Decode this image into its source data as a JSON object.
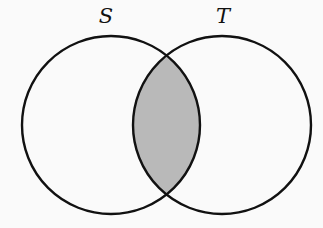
{
  "diagram": {
    "type": "venn",
    "sets": [
      {
        "label": "S",
        "cx": 111,
        "cy": 125,
        "r": 89,
        "label_x": 106,
        "label_y": 15
      },
      {
        "label": "T",
        "cx": 222,
        "cy": 125,
        "r": 89,
        "label_x": 223,
        "label_y": 15
      }
    ],
    "shaded_region": "S ∩ T",
    "colors": {
      "stroke": "#111111",
      "shade": "#b9b9b9",
      "background": "#fafafa"
    }
  }
}
